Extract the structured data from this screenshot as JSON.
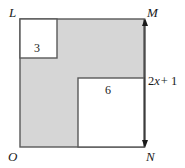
{
  "figure": {
    "colors": {
      "shaded_fill": "#d6d6d6",
      "white_fill": "#ffffff",
      "stroke": "#595959",
      "text": "#1a1a1a",
      "background": "#ffffff"
    },
    "vertices": {
      "top_left": "L",
      "top_right": "M",
      "bottom_left": "O",
      "bottom_right": "N"
    },
    "labels": {
      "small_square_side": "3",
      "large_square_side": "6"
    },
    "dimension": {
      "side_label_prefix": "2",
      "side_label_variable": "x",
      "side_label_suffix": "+ 1",
      "full_text": "2x + 1",
      "measures": "side MN"
    },
    "geometry": {
      "outer_square": {
        "x": 20,
        "y": 19,
        "width": 124,
        "height": 128
      },
      "small_white_square": {
        "x": 20,
        "y": 19,
        "width": 37,
        "height": 39
      },
      "large_white_square": {
        "x": 78,
        "y": 78,
        "width": 66,
        "height": 69
      },
      "arrow": {
        "x": 145,
        "y_top": 20,
        "y_bottom": 147,
        "heads": "both"
      }
    }
  }
}
